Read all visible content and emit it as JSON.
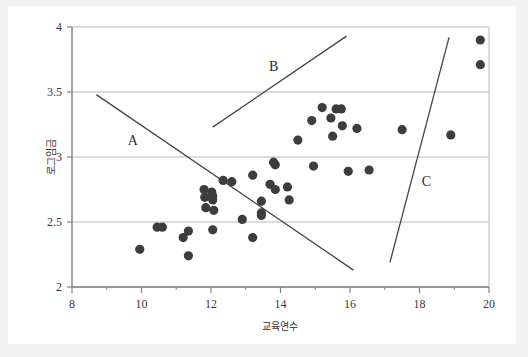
{
  "chart_data": {
    "type": "scatter",
    "title": "",
    "xlabel": "교육연수",
    "ylabel": "로그임금",
    "xlim": [
      8,
      20
    ],
    "ylim": [
      2,
      4
    ],
    "xticks": [
      8,
      10,
      12,
      14,
      16,
      18,
      20
    ],
    "xtick_labels": [
      "8",
      "10",
      "12",
      "14",
      "16",
      "18",
      "20"
    ],
    "xminorticks": [
      9,
      11,
      13,
      15,
      17,
      19
    ],
    "yticks": [
      2,
      2.5,
      3,
      3.5,
      4
    ],
    "ytick_labels": [
      "2",
      "2.5",
      "3",
      "3.5",
      "4"
    ],
    "grid": "horizontal",
    "legend": "none",
    "marker": {
      "shape": "circle",
      "color": "#3d3d3d",
      "size": 6
    },
    "points": [
      {
        "x": 9.95,
        "y": 2.29
      },
      {
        "x": 10.45,
        "y": 2.46
      },
      {
        "x": 10.6,
        "y": 2.46
      },
      {
        "x": 11.2,
        "y": 2.38
      },
      {
        "x": 11.35,
        "y": 2.43
      },
      {
        "x": 11.35,
        "y": 2.24
      },
      {
        "x": 11.8,
        "y": 2.75
      },
      {
        "x": 11.82,
        "y": 2.69
      },
      {
        "x": 11.85,
        "y": 2.61
      },
      {
        "x": 12.02,
        "y": 2.73
      },
      {
        "x": 12.05,
        "y": 2.7
      },
      {
        "x": 12.05,
        "y": 2.67
      },
      {
        "x": 12.08,
        "y": 2.59
      },
      {
        "x": 12.05,
        "y": 2.44
      },
      {
        "x": 12.35,
        "y": 2.82
      },
      {
        "x": 12.6,
        "y": 2.81
      },
      {
        "x": 12.9,
        "y": 2.52
      },
      {
        "x": 13.2,
        "y": 2.86
      },
      {
        "x": 13.2,
        "y": 2.38
      },
      {
        "x": 13.45,
        "y": 2.66
      },
      {
        "x": 13.45,
        "y": 2.57
      },
      {
        "x": 13.45,
        "y": 2.55
      },
      {
        "x": 13.7,
        "y": 2.79
      },
      {
        "x": 13.8,
        "y": 2.96
      },
      {
        "x": 13.85,
        "y": 2.94
      },
      {
        "x": 13.85,
        "y": 2.75
      },
      {
        "x": 14.2,
        "y": 2.77
      },
      {
        "x": 14.25,
        "y": 2.67
      },
      {
        "x": 14.5,
        "y": 3.13
      },
      {
        "x": 14.9,
        "y": 3.28
      },
      {
        "x": 14.95,
        "y": 2.93
      },
      {
        "x": 15.2,
        "y": 3.38
      },
      {
        "x": 15.45,
        "y": 3.3
      },
      {
        "x": 15.5,
        "y": 3.16
      },
      {
        "x": 15.6,
        "y": 3.37
      },
      {
        "x": 15.75,
        "y": 3.37
      },
      {
        "x": 15.78,
        "y": 3.24
      },
      {
        "x": 15.95,
        "y": 2.89
      },
      {
        "x": 16.2,
        "y": 3.22
      },
      {
        "x": 16.55,
        "y": 2.9
      },
      {
        "x": 17.5,
        "y": 3.21
      },
      {
        "x": 18.9,
        "y": 3.17
      },
      {
        "x": 19.75,
        "y": 3.9
      },
      {
        "x": 19.75,
        "y": 3.71
      }
    ],
    "lines": [
      {
        "name": "A",
        "label": "A",
        "x1": 8.7,
        "y1": 3.48,
        "x2": 16.1,
        "y2": 2.13,
        "label_x": 9.75,
        "label_y": 3.12,
        "color": "#444444"
      },
      {
        "name": "B",
        "label": "B",
        "x1": 12.05,
        "y1": 3.23,
        "x2": 15.9,
        "y2": 3.93,
        "label_x": 13.8,
        "label_y": 3.69,
        "color": "#444444"
      },
      {
        "name": "C",
        "label": "C",
        "x1": 17.15,
        "y1": 2.19,
        "x2": 18.85,
        "y2": 3.92,
        "label_x": 18.2,
        "label_y": 2.81,
        "color": "#444444"
      }
    ],
    "colors": {
      "background": "#ffffff",
      "page_background": "#f2f2f2",
      "grid": "#b8b8b8",
      "axis": "#808080",
      "text": "#333333",
      "marker": "#3d3d3d",
      "line": "#444444"
    }
  }
}
